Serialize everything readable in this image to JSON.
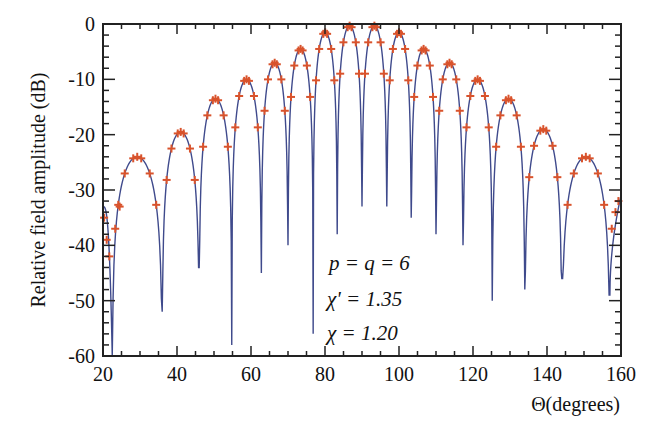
{
  "chart_data": {
    "type": "line",
    "title": "",
    "xlabel": "Θ(degrees)",
    "ylabel": "Relative field amplitude (dB)",
    "xlim": [
      20,
      160
    ],
    "ylim": [
      -60,
      0
    ],
    "x_ticks": [
      20,
      40,
      60,
      80,
      100,
      120,
      140,
      160
    ],
    "y_ticks": [
      0,
      -10,
      -20,
      -30,
      -40,
      -50,
      -60
    ],
    "grid": false,
    "legend": null,
    "annotations": [
      "p = q = 6",
      "χ' = 1.35",
      "χ  = 1.20"
    ],
    "series": [
      {
        "name": "computed pattern",
        "style": "line",
        "color": "#3f4a8c",
        "lobe_peaks": [
          {
            "x": 30.5,
            "y": -24.0
          },
          {
            "x": 41.5,
            "y": -19.5
          },
          {
            "x": 51.5,
            "y": -13.5
          },
          {
            "x": 59.5,
            "y": -10.0
          },
          {
            "x": 66.5,
            "y": -7.0
          },
          {
            "x": 73.5,
            "y": -4.5
          },
          {
            "x": 80.0,
            "y": -1.5
          },
          {
            "x": 86.5,
            "y": -0.3
          },
          {
            "x": 93.5,
            "y": -0.3
          },
          {
            "x": 100.0,
            "y": -1.5
          },
          {
            "x": 106.5,
            "y": -4.5
          },
          {
            "x": 113.5,
            "y": -7.0
          },
          {
            "x": 120.5,
            "y": -10.0
          },
          {
            "x": 128.5,
            "y": -13.5
          },
          {
            "x": 138.5,
            "y": -19.0
          },
          {
            "x": 149.5,
            "y": -24.0
          }
        ],
        "nulls": [
          {
            "x": 22.5,
            "y": -60
          },
          {
            "x": 36.0,
            "y": -52
          },
          {
            "x": 46.0,
            "y": -44
          },
          {
            "x": 54.8,
            "y": -58
          },
          {
            "x": 62.8,
            "y": -45
          },
          {
            "x": 70.0,
            "y": -40
          },
          {
            "x": 76.8,
            "y": -56
          },
          {
            "x": 83.3,
            "y": -38
          },
          {
            "x": 90.0,
            "y": -33
          },
          {
            "x": 96.7,
            "y": -33
          },
          {
            "x": 103.3,
            "y": -35
          },
          {
            "x": 110.0,
            "y": -38
          },
          {
            "x": 117.3,
            "y": -40
          },
          {
            "x": 125.2,
            "y": -50
          },
          {
            "x": 134.0,
            "y": -48
          },
          {
            "x": 144.0,
            "y": -46
          },
          {
            "x": 157.0,
            "y": -49
          }
        ]
      },
      {
        "name": "measured samples",
        "style": "markers",
        "marker": "+",
        "color": "#d9532c"
      }
    ]
  },
  "colors": {
    "curve": "#3f4a8c",
    "markers": "#d9532c",
    "axes": "#222222"
  }
}
